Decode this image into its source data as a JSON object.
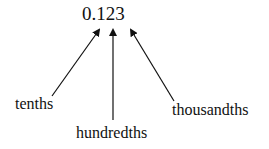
{
  "diagram": {
    "number": "0.123",
    "labels": {
      "tenths": "tenths",
      "hundredths": "hundredths",
      "thousandths": "thousandths"
    },
    "arrows": [
      {
        "from": "tenths",
        "to_digit": "1"
      },
      {
        "from": "hundredths",
        "to_digit": "2"
      },
      {
        "from": "thousandths",
        "to_digit": "3"
      }
    ],
    "colors": {
      "ink": "#111111",
      "background": "#ffffff"
    }
  }
}
